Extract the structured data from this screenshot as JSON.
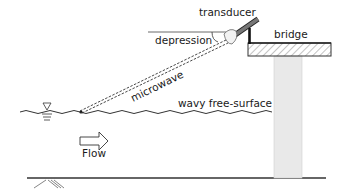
{
  "diagram": {
    "labels": {
      "transducer": "transducer",
      "bridge": "bridge",
      "depression": "depression",
      "microwave": "microwave",
      "free_surface": "wavy free-surface",
      "flow": "Flow"
    },
    "components": [
      {
        "id": "transducer",
        "description": "microwave transducer mounted on bridge, pointing down-upstream at a depression angle"
      },
      {
        "id": "bridge",
        "description": "bridge deck with hatched section supported by pillar"
      },
      {
        "id": "pillar",
        "description": "bridge pier"
      },
      {
        "id": "microwave-beam",
        "description": "dashed beam from transducer to water surface"
      },
      {
        "id": "free-surface",
        "description": "wavy water free-surface with water-level symbol"
      },
      {
        "id": "flow-arrow",
        "description": "hollow arrow indicating flow direction to the right"
      },
      {
        "id": "channel-bed",
        "description": "riverbed line with ground hatching"
      }
    ],
    "colors": {
      "line": "#2a2a2a",
      "rod": "#6e6e6e",
      "pillar": "#e9e9e9",
      "hatch": "#9a9a9a"
    }
  }
}
